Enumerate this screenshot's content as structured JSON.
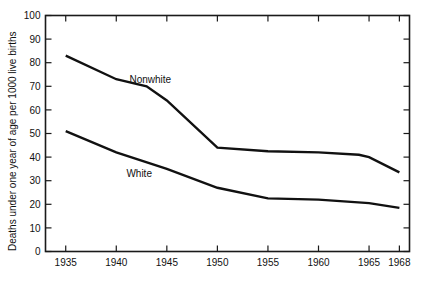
{
  "chart_data": {
    "type": "line",
    "title": "",
    "xlabel": "",
    "ylabel": "Deaths under one year of age per 1000 live births",
    "xlim": [
      1933,
      1969
    ],
    "ylim": [
      0,
      100
    ],
    "ytick_values": [
      0,
      10,
      20,
      30,
      40,
      50,
      60,
      70,
      80,
      90,
      100
    ],
    "ytick_labels": [
      "0",
      "10",
      "20",
      "30",
      "40",
      "50",
      "60",
      "70",
      "80",
      "90",
      "100"
    ],
    "xtick_values": [
      1935,
      1940,
      1945,
      1950,
      1955,
      1960,
      1965,
      1968
    ],
    "xtick_labels": [
      "1935",
      "1940",
      "1945",
      "1950",
      "1955",
      "1960",
      "1965",
      "1968"
    ],
    "grid": false,
    "legend_position": "inline-annotations",
    "series": [
      {
        "name": "Nonwhite",
        "label": "Nonwhite",
        "color": "#111111",
        "x": [
          1935,
          1940,
          1943,
          1945,
          1950,
          1955,
          1960,
          1964,
          1965,
          1968
        ],
        "values": [
          83,
          73,
          70,
          64,
          44,
          42.5,
          42,
          41,
          40,
          33.5
        ]
      },
      {
        "name": "White",
        "label": "White",
        "color": "#111111",
        "x": [
          1935,
          1940,
          1945,
          1950,
          1955,
          1960,
          1965,
          1968
        ],
        "values": [
          51,
          42,
          35,
          27,
          22.5,
          22,
          20.5,
          18.5
        ]
      }
    ],
    "annotations": [
      {
        "text": "Nonwhite",
        "x": 1941.3,
        "y": 71.5
      },
      {
        "text": "White",
        "x": 1941.0,
        "y": 31.5
      }
    ]
  }
}
